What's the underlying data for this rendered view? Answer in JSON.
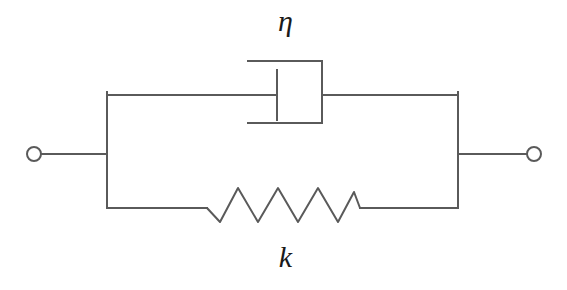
{
  "figure": {
    "background_color": "#ffffff",
    "stroke_color": "#5a5a5a",
    "label_color": "#1a1a1a",
    "stroke_width": 2,
    "width": 567,
    "height": 290
  },
  "labels": {
    "dashpot": "η",
    "spring": "k"
  },
  "elements": {
    "left_terminal": {
      "name": "left-terminal-node",
      "cx": 34,
      "cy": 154,
      "r": 7
    },
    "right_terminal": {
      "name": "right-terminal-node",
      "cx": 534,
      "cy": 154,
      "r": 7
    },
    "left_lead": {
      "x1": 41,
      "y1": 154,
      "x2": 107,
      "y2": 154
    },
    "right_lead": {
      "x1": 458,
      "y1": 154,
      "x2": 527,
      "y2": 154
    },
    "left_bus": {
      "x": 107,
      "y1": 92,
      "y2": 208
    },
    "right_bus": {
      "x": 458,
      "y1": 92,
      "y2": 208
    },
    "dashpot": {
      "name": "dashpot-symbol",
      "cylinder_top": {
        "x1": 248,
        "y1": 61,
        "x2": 322,
        "y2": 61
      },
      "cylinder_right": {
        "x1": 322,
        "y1": 61,
        "x2": 322,
        "y2": 123
      },
      "cylinder_bottom": {
        "x1": 248,
        "y1": 123,
        "x2": 322,
        "y2": 123
      },
      "piston_rod_left": {
        "x1": 107,
        "y1": 95,
        "x2": 277,
        "y2": 95
      },
      "piston_plate": {
        "x1": 277,
        "y1": 70,
        "x2": 277,
        "y2": 120
      },
      "outlet_right": {
        "x1": 322,
        "y1": 95,
        "x2": 458,
        "y2": 95
      }
    },
    "spring": {
      "name": "spring-symbol",
      "baseline_y": 208,
      "lead_left": {
        "x1": 107,
        "y1": 208,
        "x2": 207,
        "y2": 208
      },
      "lead_right": {
        "x1": 360,
        "y1": 208,
        "x2": 458,
        "y2": 208
      },
      "peak_y": 188,
      "valley_y": 222,
      "coil_points": "207,208 220,222 238,188 258,222 278,188 298,222 318,188 338,222 354,192 360,208"
    }
  }
}
